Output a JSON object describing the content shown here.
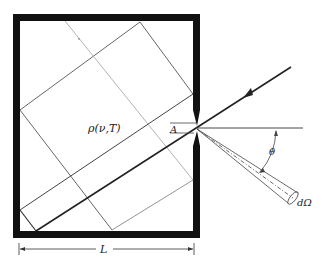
{
  "diagram": {
    "labels": {
      "energy_density": "ρ(ν,T)",
      "aperture_area": "A",
      "angle": "θ",
      "solid_angle": "dΩ",
      "length": "L"
    },
    "colors": {
      "wall": "#111111",
      "ray": "#222222",
      "thin_line": "#555555",
      "faint_line": "#aaaaaa"
    }
  }
}
